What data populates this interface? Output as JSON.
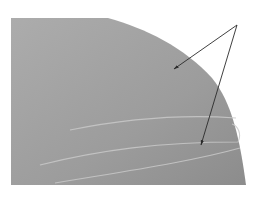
{
  "figure": {
    "type": "grayscale illustration with annotation arrows",
    "shape": {
      "description": "gray region with flat top and left edges and a convex curved right edge",
      "fill_top": "#a8a8a8",
      "fill_bottom": "#909090",
      "edge_highlight": "#8a8a8a"
    },
    "streaks": {
      "description": "faint light curved lines across lower part of the region",
      "color": "#c8c8c8",
      "count": 3
    },
    "arrows": {
      "color": "#2a2a2a",
      "origin": [
        237,
        25
      ],
      "targets": [
        [
          173,
          70
        ],
        [
          200,
          146
        ]
      ],
      "count": 2
    }
  }
}
